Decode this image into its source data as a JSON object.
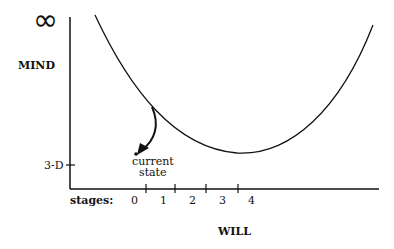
{
  "diagram": {
    "y_axis": {
      "top_label": "∞",
      "label": "MIND",
      "tick_label": "3-D"
    },
    "x_axis": {
      "prefix_label": "stages:",
      "stage_labels": [
        "0",
        "1",
        "2",
        "3",
        "4"
      ],
      "label": "WILL"
    },
    "annotation": {
      "line1": "current",
      "line2": "state"
    },
    "colors": {
      "ink": "#111111",
      "background": "#ffffff"
    }
  }
}
